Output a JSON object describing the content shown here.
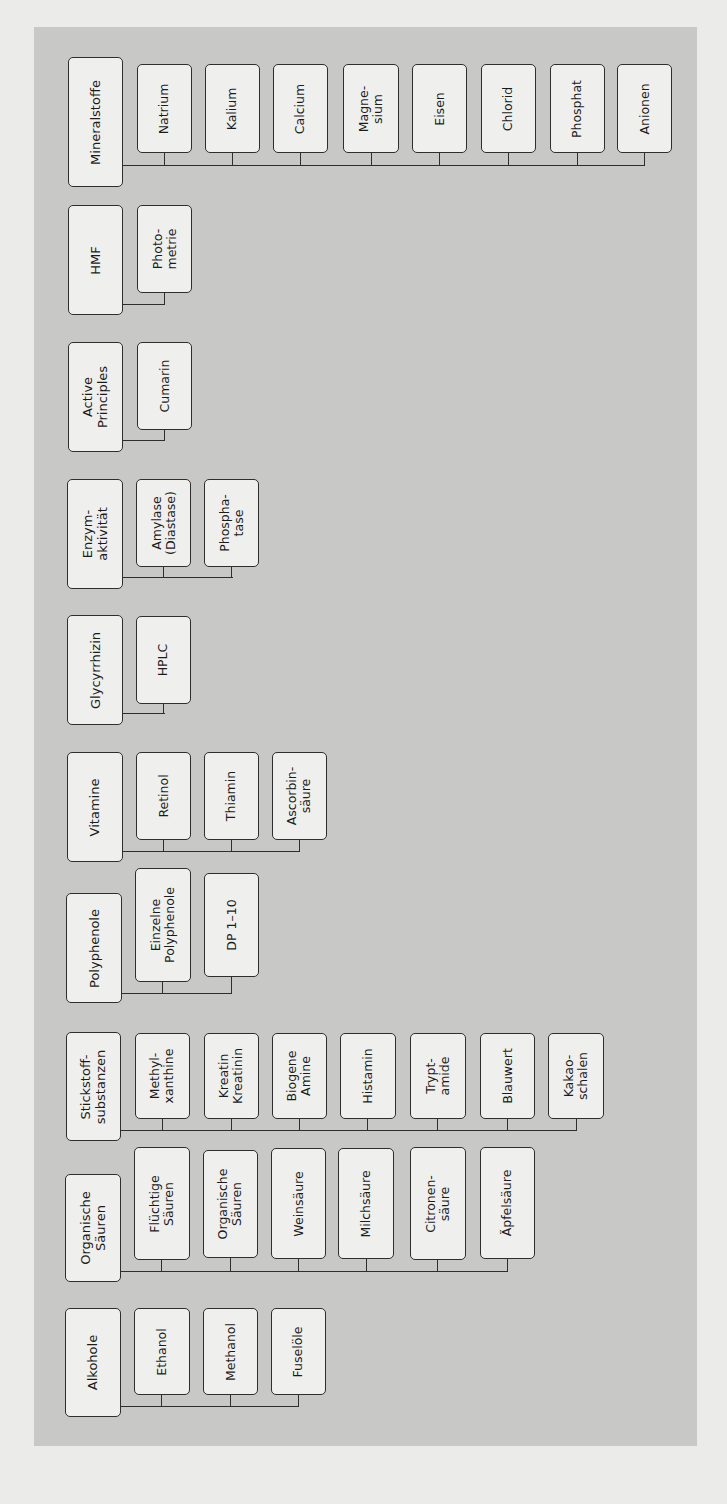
{
  "colors": {
    "page_background": "#ebebe9",
    "panel_background": "#c8c8c6",
    "box_fill": "#efefed",
    "box_border": "#2e2e2e"
  },
  "diagram": {
    "orientation": "rotated-90-ccw",
    "groups": [
      {
        "id": "mineralstoffe",
        "label": "Mineralstoffe",
        "children": [
          "Natrium",
          "Kalium",
          "Calcium",
          "Magne-\nsium",
          "Eisen",
          "Chlorid",
          "Phosphat",
          "Anionen"
        ]
      },
      {
        "id": "hmf",
        "label": "HMF",
        "children": [
          "Photo-\nmetrie"
        ]
      },
      {
        "id": "active-principles",
        "label": "Active\nPrinciples",
        "children": [
          "Cumarin"
        ]
      },
      {
        "id": "enzymaktivitaet",
        "label": "Enzym-\naktivität",
        "children": [
          "Amylase\n(Diastase)",
          "Phospha-\ntase"
        ]
      },
      {
        "id": "glycyrrhizin",
        "label": "Glycyrrhizin",
        "children": [
          "HPLC"
        ]
      },
      {
        "id": "vitamine",
        "label": "Vitamine",
        "children": [
          "Retinol",
          "Thiamin",
          "Ascorbin-\nsäure"
        ]
      },
      {
        "id": "polyphenole",
        "label": "Polyphenole",
        "children": [
          "Einzelne\nPolyphenole",
          "DP 1–10"
        ]
      },
      {
        "id": "stickstoffsubstanzen",
        "label": "Stickstoff-\nsubstanzen",
        "children": [
          "Methyl-\nxanthine",
          "Kreatin\nKreatinin",
          "Biogene\nAmine",
          "Histamin",
          "Trypt-\namide",
          "Blauwert",
          "Kakao-\nschalen"
        ]
      },
      {
        "id": "organische-saeuren",
        "label": "Organische\nSäuren",
        "children": [
          "Flüchtige\nSäuren",
          "Organische\nSäuren",
          "Weinsäure",
          "Milchsäure",
          "Citronen-\nsäure",
          "Äpfelsäure"
        ]
      },
      {
        "id": "alkohole",
        "label": "Alkohole",
        "children": [
          "Ethanol",
          "Methanol",
          "Fuselöle"
        ]
      }
    ]
  }
}
